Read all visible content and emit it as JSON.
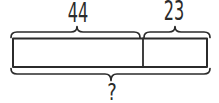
{
  "diagram": {
    "type": "tape-diagram",
    "parts": [
      {
        "label": "44"
      },
      {
        "label": "23"
      }
    ],
    "total": {
      "label": "?"
    },
    "colors": {
      "stroke": "#2b2b2b",
      "background": "#ffffff"
    }
  }
}
